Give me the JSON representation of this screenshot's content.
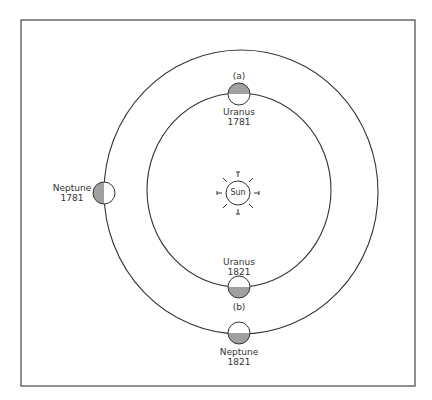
{
  "diagram": {
    "sun": {
      "label": "Sun",
      "cx": 238,
      "cy": 193,
      "r": 12
    },
    "orbits": [
      {
        "name": "inner-orbit-uranus",
        "cx": 239,
        "cy": 190,
        "rx": 92,
        "ry": 97
      },
      {
        "name": "outer-orbit-neptune",
        "cx": 241,
        "cy": 192,
        "rx": 137,
        "ry": 142
      }
    ],
    "planets": [
      {
        "id": "uranus-1781",
        "planet": "Uranus",
        "year": "1781",
        "cx": 239,
        "cy": 94,
        "shade": "top",
        "marker": "(a)"
      },
      {
        "id": "neptune-1781",
        "planet": "Neptune",
        "year": "1781",
        "cx": 104,
        "cy": 193,
        "shade": "left"
      },
      {
        "id": "uranus-1821",
        "planet": "Uranus",
        "year": "1821",
        "cx": 239,
        "cy": 287,
        "shade": "bottom",
        "marker": "(b)"
      },
      {
        "id": "neptune-1821",
        "planet": "Neptune",
        "year": "1821",
        "cx": 239,
        "cy": 333,
        "shade": "bottom"
      }
    ],
    "labels": {
      "marker_a": "(a)",
      "marker_b": "(b)",
      "uranus_1781_name": "Uranus",
      "uranus_1781_year": "1781",
      "neptune_1781_name": "Neptune",
      "neptune_1781_year": "1781",
      "uranus_1821_name": "Uranus",
      "uranus_1821_year": "1821",
      "neptune_1821_name": "Neptune",
      "neptune_1821_year": "1821",
      "sun": "Sun"
    },
    "colors": {
      "line": "#333333",
      "shade": "#a0a0a0",
      "frame": "#444444"
    }
  }
}
